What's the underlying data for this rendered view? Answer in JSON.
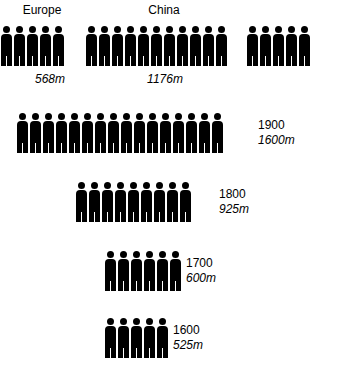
{
  "chart_data": {
    "type": "pictogram",
    "title": "",
    "subtitle": "",
    "xlabel": "",
    "ylabel": "",
    "unit_note": "each figure represents approximately 100 million people",
    "legend_position": "none",
    "grid": false,
    "icon": "person-icon",
    "icon_color": "#000000",
    "top_row": {
      "groups": [
        {
          "name": "Europe",
          "label": "Europe",
          "value_label": "568m",
          "value": 568,
          "figures": 5
        },
        {
          "name": "China",
          "label": "China",
          "value_label": "1176m",
          "value": 1176,
          "figures": 11
        },
        {
          "name": "unlabeled",
          "label": "",
          "value_label": "",
          "value": null,
          "figures": 5
        }
      ]
    },
    "year_rows": [
      {
        "year_label": "1900",
        "year": 1900,
        "value_label": "1600m",
        "value": 1600,
        "figures": 16
      },
      {
        "year_label": "1800",
        "year": 1800,
        "value_label": "925m",
        "value": 925,
        "figures": 9
      },
      {
        "year_label": "1700",
        "year": 1700,
        "value_label": "600m",
        "value": 600,
        "figures": 6
      },
      {
        "year_label": "1600",
        "year": 1600,
        "value_label": "525m",
        "value": 525,
        "figures": 5
      }
    ]
  }
}
